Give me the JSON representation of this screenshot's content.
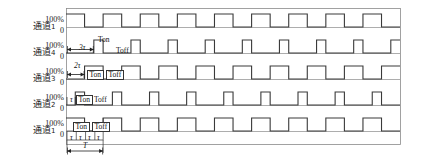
{
  "figure": {
    "type": "timing-diagram",
    "axis_top_label": "100%",
    "axis_bottom_label": "0",
    "period_label": "T",
    "tau_label": "τ",
    "on_label": "Ton",
    "off_label": "Toff",
    "stroke_color": "#3a3a3a",
    "frame_color": "#8a8a8a",
    "text_color": "#1a1a1a"
  },
  "rows": [
    {
      "channel_label": "通道",
      "channel_index": "1",
      "top": "100%",
      "bottom": "0",
      "delay_label": "",
      "duty_tau_on": 2,
      "duty_tau_off": 2,
      "delay_tau": 0,
      "show_ton_toff": false
    },
    {
      "channel_label": "通道",
      "channel_index": "4",
      "top": "100%",
      "bottom": "0",
      "delay_label": "3τ",
      "duty_tau_on": 1,
      "duty_tau_off": 3,
      "delay_tau": 3,
      "show_ton_toff": true
    },
    {
      "channel_label": "通道",
      "channel_index": "3",
      "top": "100%",
      "bottom": "0",
      "delay_label": "2τ",
      "duty_tau_on": 2,
      "duty_tau_off": 2,
      "delay_tau": 2,
      "show_ton_toff": true
    },
    {
      "channel_label": "通道",
      "channel_index": "2",
      "top": "100%",
      "bottom": "0",
      "delay_label": "τ",
      "duty_tau_on": 1,
      "duty_tau_off": 3,
      "delay_tau": 1,
      "show_ton_toff": true
    },
    {
      "channel_label": "通道",
      "channel_index": "1",
      "top": "100%",
      "bottom": "0",
      "delay_label": "",
      "duty_tau_on": 2,
      "duty_tau_off": 2,
      "delay_tau": 0,
      "show_ton_toff": true
    }
  ],
  "scale_ruler": {
    "segments": [
      "τ",
      "τ",
      "τ",
      "τ"
    ],
    "period": "T"
  },
  "chart_data": {
    "type": "line",
    "title": "",
    "xlabel": "",
    "ylabel": "",
    "ylim": [
      0,
      100
    ],
    "x_unit": "τ",
    "period_tau": 4,
    "n_periods_visible": 9,
    "series": [
      {
        "name": "通道1 (top)",
        "duty_percent": 50,
        "on_tau": 2,
        "off_tau": 2,
        "phase_delay_tau": 0,
        "levels_percent": [
          100,
          100,
          0,
          0
        ]
      },
      {
        "name": "通道4",
        "duty_percent": 25,
        "on_tau": 1,
        "off_tau": 3,
        "phase_delay_tau": 3,
        "levels_percent": [
          0,
          0,
          0,
          100
        ]
      },
      {
        "name": "通道3",
        "duty_percent": 50,
        "on_tau": 2,
        "off_tau": 2,
        "phase_delay_tau": 2,
        "levels_percent": [
          0,
          0,
          100,
          100
        ]
      },
      {
        "name": "通道2",
        "duty_percent": 25,
        "on_tau": 1,
        "off_tau": 3,
        "phase_delay_tau": 1,
        "levels_percent": [
          0,
          100,
          0,
          0
        ]
      },
      {
        "name": "通道1 (bottom)",
        "duty_percent": 50,
        "on_tau": 2,
        "off_tau": 2,
        "phase_delay_tau": 0,
        "levels_percent": [
          100,
          100,
          0,
          0
        ]
      }
    ],
    "legend_position": "left-labels",
    "grid": false
  }
}
